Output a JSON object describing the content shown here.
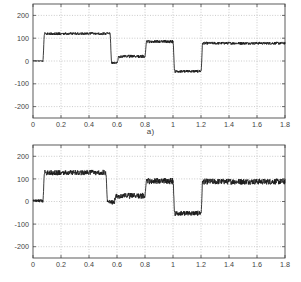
{
  "figure": {
    "background_color": "#ffffff",
    "axis_color": "#4a4a4a",
    "grid_color": "#b4b4b4",
    "trace_color": "#1a1a1a"
  },
  "panels": [
    {
      "id": "a",
      "caption": "a)",
      "y_ticks": [
        "200",
        "100",
        "0",
        "-100",
        "-200"
      ],
      "x_ticks": [
        "0",
        "0.2",
        "0.4",
        "0.6",
        "0.8",
        "1",
        "1.2",
        "1.4",
        "1.6",
        "1.8"
      ]
    },
    {
      "id": "b",
      "caption": "b)",
      "y_ticks": [
        "200",
        "100",
        "0",
        "-100",
        "-200"
      ],
      "x_ticks": [
        "0",
        "0.2",
        "0.4",
        "0.6",
        "0.8",
        "1",
        "1.2",
        "1.4",
        "1.6",
        "1.8"
      ]
    }
  ],
  "chart_data": [
    {
      "type": "line",
      "title": "",
      "subtitle": "a)",
      "xlabel": "",
      "ylabel": "",
      "xlim": [
        0,
        1.8
      ],
      "ylim": [
        -250,
        250
      ],
      "xticks": [
        0,
        0.2,
        0.4,
        0.6,
        0.8,
        1.0,
        1.2,
        1.4,
        1.6,
        1.8
      ],
      "yticks": [
        200,
        100,
        0,
        -100,
        -200
      ],
      "grid": true,
      "legend": "none",
      "series": [
        {
          "name": "step response a",
          "description": "Staircase step waveform with small ripple noise band",
          "steps": [
            {
              "t_start": 0.0,
              "t_end": 0.07,
              "level": 0,
              "ripple": 2
            },
            {
              "t_start": 0.07,
              "t_end": 0.55,
              "level": 120,
              "ripple": 6
            },
            {
              "t_start": 0.55,
              "t_end": 0.6,
              "level": -8,
              "ripple": 5
            },
            {
              "t_start": 0.6,
              "t_end": 0.8,
              "level": 20,
              "ripple": 7
            },
            {
              "t_start": 0.8,
              "t_end": 1.0,
              "level": 85,
              "ripple": 7
            },
            {
              "t_start": 1.0,
              "t_end": 1.2,
              "level": -45,
              "ripple": 6
            },
            {
              "t_start": 1.2,
              "t_end": 1.8,
              "level": 78,
              "ripple": 6
            }
          ]
        }
      ]
    },
    {
      "type": "line",
      "title": "",
      "subtitle": "b)",
      "xlabel": "",
      "ylabel": "",
      "xlim": [
        0,
        1.8
      ],
      "ylim": [
        -250,
        250
      ],
      "xticks": [
        0,
        0.2,
        0.4,
        0.6,
        0.8,
        1.0,
        1.2,
        1.4,
        1.6,
        1.8
      ],
      "yticks": [
        200,
        100,
        0,
        -100,
        -200
      ],
      "grid": true,
      "legend": "none",
      "series": [
        {
          "name": "step response b",
          "description": "Same staircase step waveform with larger high-frequency noise band",
          "steps": [
            {
              "t_start": 0.0,
              "t_end": 0.07,
              "level": 3,
              "ripple": 7
            },
            {
              "t_start": 0.07,
              "t_end": 0.52,
              "level": 128,
              "ripple": 12
            },
            {
              "t_start": 0.52,
              "t_end": 0.58,
              "level": -3,
              "ripple": 10
            },
            {
              "t_start": 0.58,
              "t_end": 0.8,
              "level": 25,
              "ripple": 13
            },
            {
              "t_start": 0.8,
              "t_end": 1.0,
              "level": 90,
              "ripple": 14
            },
            {
              "t_start": 1.0,
              "t_end": 1.2,
              "level": -52,
              "ripple": 11
            },
            {
              "t_start": 1.2,
              "t_end": 1.8,
              "level": 88,
              "ripple": 13
            }
          ]
        }
      ]
    }
  ]
}
